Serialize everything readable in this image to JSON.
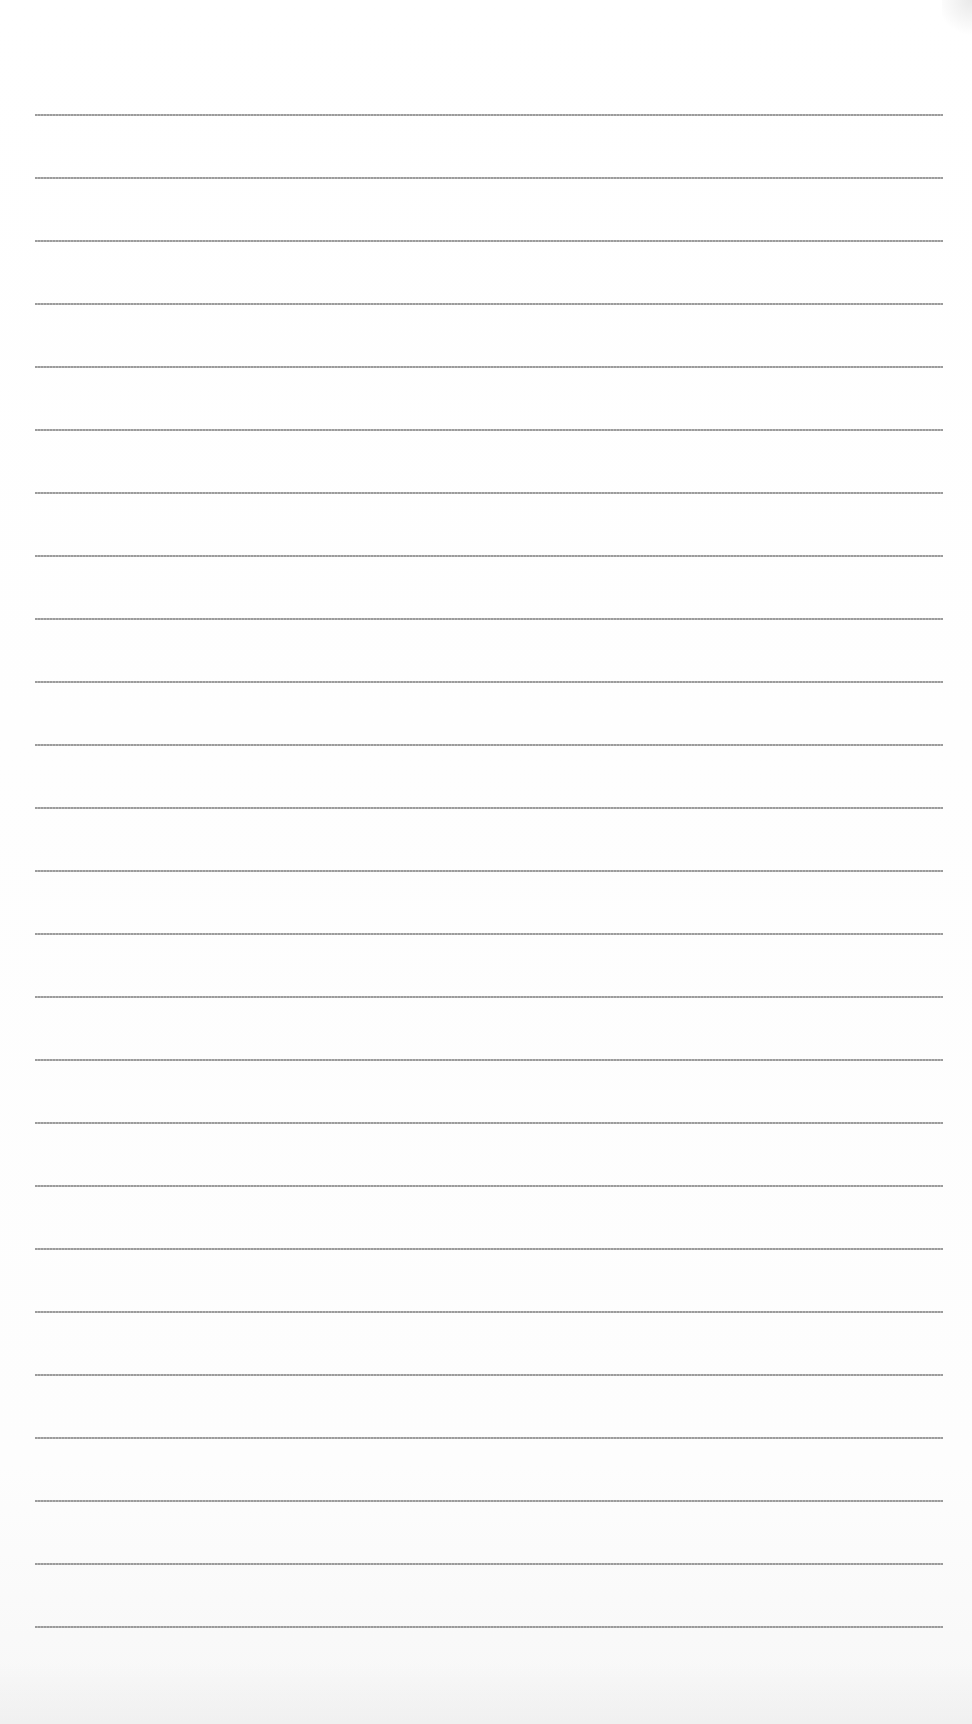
{
  "page": {
    "type": "lined-paper",
    "line_count": 25,
    "first_line_y": 114,
    "line_spacing": 63,
    "line_left": 35,
    "line_right": 943,
    "line_color": "#8a8a8a",
    "paper_color": "#ffffff"
  }
}
